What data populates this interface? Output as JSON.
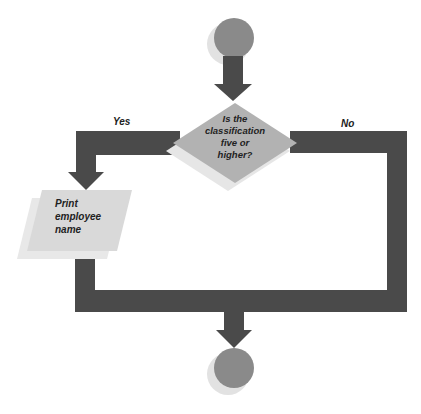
{
  "diagram": {
    "type": "flowchart",
    "colors": {
      "connector": "#4a4a4a",
      "terminal": "#8a8a8a",
      "terminal_shadow": "#e2e2e2",
      "decision": "#b2b2b2",
      "decision_shadow": "#e6e6e6",
      "io": "#d9d9d9",
      "io_shadow": "#e8e8e8"
    },
    "nodes": [
      {
        "id": "start",
        "shape": "circle",
        "label": ""
      },
      {
        "id": "decision",
        "shape": "diamond",
        "label_lines": [
          "Is the",
          "classification",
          "five or",
          "higher?"
        ]
      },
      {
        "id": "print",
        "shape": "parallelogram",
        "label_lines": [
          "Print",
          "employee",
          "name"
        ]
      },
      {
        "id": "end",
        "shape": "circle",
        "label": ""
      }
    ],
    "edges": [
      {
        "from": "start",
        "to": "decision",
        "label": ""
      },
      {
        "from": "decision",
        "to": "print",
        "label": "Yes"
      },
      {
        "from": "decision",
        "to": "end",
        "label": "No"
      },
      {
        "from": "print",
        "to": "end",
        "label": ""
      }
    ],
    "yes_label": "Yes",
    "no_label": "No"
  }
}
